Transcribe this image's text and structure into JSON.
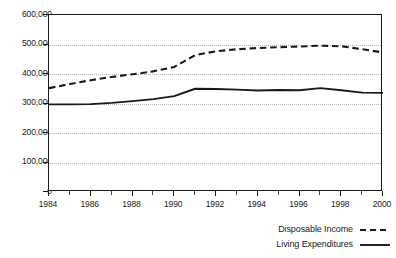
{
  "chart_data": {
    "type": "line",
    "title": "",
    "subtitle": "",
    "xlabel": "",
    "ylabel": "",
    "x": [
      1984,
      1985,
      1986,
      1987,
      1988,
      1989,
      1990,
      1991,
      1992,
      1993,
      1994,
      1995,
      1996,
      1997,
      1998,
      1999,
      2000
    ],
    "xlim": [
      1984,
      2000
    ],
    "ylim": [
      0,
      600000
    ],
    "yticks": [
      0,
      100000,
      200000,
      300000,
      400000,
      500000,
      600000
    ],
    "ytick_labels": [
      "0",
      "100,000",
      "200,000",
      "300,000",
      "400,000",
      "500,000",
      "600,000"
    ],
    "xticks": [
      1984,
      1986,
      1988,
      1990,
      1992,
      1994,
      1996,
      1998,
      2000
    ],
    "xtick_labels": [
      "1984",
      "1986",
      "1988",
      "1990",
      "1992",
      "1994",
      "1996",
      "1998",
      "2000"
    ],
    "grid": true,
    "grid_axis": "y",
    "legend_position": "bottom-right",
    "series": [
      {
        "name": "Disposable Income",
        "style": "dashed",
        "color": "#1a1a1a",
        "values": [
          352000,
          366000,
          379000,
          390000,
          399000,
          409000,
          424000,
          464000,
          477000,
          484000,
          488000,
          491000,
          493000,
          496000,
          494000,
          484000,
          473000
        ]
      },
      {
        "name": "Living Expenditures",
        "style": "solid",
        "color": "#1a1a1a",
        "values": [
          297000,
          297000,
          298000,
          302000,
          308000,
          315000,
          325000,
          350000,
          349000,
          347000,
          344000,
          346000,
          345000,
          352000,
          345000,
          337000,
          336000
        ]
      }
    ]
  },
  "legend": {
    "items": [
      {
        "label": "Disposable Income",
        "style": "dashed"
      },
      {
        "label": "Living Expenditures",
        "style": "solid"
      }
    ]
  }
}
